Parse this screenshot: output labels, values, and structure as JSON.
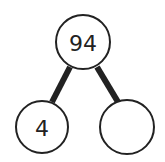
{
  "diagram": {
    "type": "number-bond",
    "nodes": [
      {
        "id": "whole",
        "label": "94",
        "cx": 83,
        "cy": 42,
        "r": 27
      },
      {
        "id": "part-left",
        "label": "4",
        "cx": 42,
        "cy": 127,
        "r": 26
      },
      {
        "id": "part-right",
        "label": "",
        "cx": 127,
        "cy": 127,
        "r": 27
      }
    ],
    "edges": [
      {
        "from": "whole",
        "to": "part-left"
      },
      {
        "from": "whole",
        "to": "part-right"
      }
    ],
    "colors": {
      "stroke": "#222222",
      "fill": "#ffffff"
    }
  }
}
